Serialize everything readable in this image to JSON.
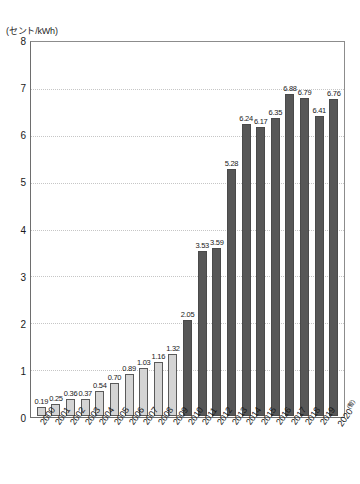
{
  "chart_data": {
    "type": "bar",
    "title": "",
    "subtitle": "",
    "unit_label": "(セント/kWh)",
    "xlabel": "",
    "ylabel": "",
    "ylim": [
      0,
      8
    ],
    "y_ticks": [
      0,
      1,
      2,
      3,
      4,
      5,
      6,
      7,
      8
    ],
    "y_tick_labels": [
      "0",
      "1",
      "2",
      "3",
      "4",
      "5",
      "6",
      "7",
      "8"
    ],
    "grid": true,
    "grid_axis": "y",
    "legend": null,
    "categories": [
      "2000",
      "2001",
      "2002",
      "2003",
      "2004",
      "2005",
      "2006",
      "2007",
      "2008",
      "2009",
      "2010",
      "2011",
      "2012",
      "2013",
      "2014",
      "2015",
      "2016",
      "2017",
      "2018",
      "2019",
      "2020"
    ],
    "category_notes": {
      "2020": "(暫)"
    },
    "values": [
      0.19,
      0.25,
      0.36,
      0.37,
      0.54,
      0.7,
      0.89,
      1.03,
      1.16,
      1.32,
      2.05,
      3.53,
      3.59,
      5.28,
      6.24,
      6.17,
      6.35,
      6.88,
      6.79,
      6.41,
      6.76
    ],
    "value_labels": [
      "0.19",
      "0.25",
      "0.36",
      "0.37",
      "0.54",
      "0.70",
      "0.89",
      "1.03",
      "1.16",
      "1.32",
      "2.05",
      "3.53",
      "3.59",
      "5.28",
      "6.24",
      "6.17",
      "6.35",
      "6.88",
      "6.79",
      "6.41",
      "6.76"
    ],
    "bar_styles": [
      "light",
      "light",
      "light",
      "light",
      "light",
      "light",
      "light",
      "light",
      "light",
      "light",
      "dark",
      "dark",
      "dark",
      "dark",
      "dark",
      "dark",
      "dark",
      "dark",
      "dark",
      "dark",
      "dark"
    ],
    "colors": {
      "light_bar_fill": "#d4d4d4",
      "light_bar_border": "#5a5a5a",
      "dark_bar_fill": "#575757",
      "dark_bar_border": "#4a4a4a",
      "grid": "#c6c6c6",
      "axis": "#6e6e6e",
      "text": "#1a1a1a",
      "background": "#ffffff"
    }
  }
}
